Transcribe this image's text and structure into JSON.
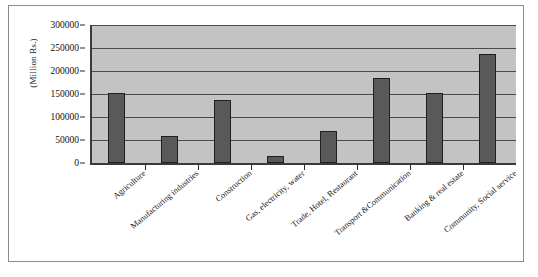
{
  "chart_data": {
    "type": "bar",
    "title": "",
    "xlabel": "",
    "ylabel": "(Million Rs.)",
    "ylim": [
      0,
      300000
    ],
    "ytick_step": 50000,
    "yticks": [
      "0",
      "50000",
      "100000",
      "150000",
      "200000",
      "250000",
      "300000"
    ],
    "ytick_values": [
      0,
      50000,
      100000,
      150000,
      200000,
      250000,
      300000
    ],
    "grid": true,
    "legend": "none",
    "categories": [
      "Agriculture",
      "Manufacturing industries",
      "Construction",
      "Gas, electricity, water",
      "Trade, Hotel, Restaurant",
      "Transport &Communication",
      "Banking & real estate",
      "Community, Social service"
    ],
    "values": [
      152000,
      59000,
      137000,
      15000,
      70000,
      184000,
      153000,
      238000
    ],
    "series": [
      {
        "name": "Value",
        "color": "#595959",
        "values": [
          152000,
          59000,
          137000,
          15000,
          70000,
          184000,
          153000,
          238000
        ]
      }
    ]
  },
  "style": {
    "plot_background": "#c3c3c3",
    "bar_color": "#595959",
    "bar_edge_color": "#1f1f1f",
    "gridline_color": "#4a4a4a",
    "axis_color": "#3a3a3a",
    "frame_color": "#8c8c8c",
    "figure_background": "#ffffff",
    "text_color": "#1a1a1a"
  }
}
